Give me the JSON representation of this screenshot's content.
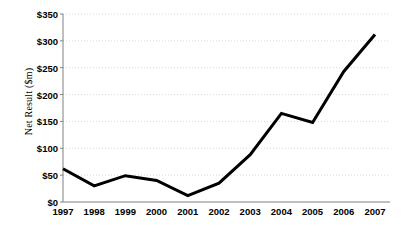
{
  "chart_data": {
    "type": "line",
    "title": "",
    "xlabel": "",
    "ylabel": "Net Result ($m)",
    "categories": [
      "1997",
      "1998",
      "1999",
      "2000",
      "2001",
      "2002",
      "2003",
      "2004",
      "2005",
      "2006",
      "2007"
    ],
    "x": [
      1997,
      1998,
      1999,
      2000,
      2001,
      2002,
      2003,
      2004,
      2005,
      2006,
      2007
    ],
    "values": [
      62,
      30,
      49,
      40,
      12,
      35,
      88,
      165,
      148,
      243,
      312
    ],
    "series": [
      {
        "name": "Net Result",
        "values": [
          62,
          30,
          49,
          40,
          12,
          35,
          88,
          165,
          148,
          243,
          312
        ]
      }
    ],
    "ylim": [
      0,
      350
    ],
    "ytick_values": [
      0,
      50,
      100,
      150,
      200,
      250,
      300,
      350
    ],
    "ytick_labels": [
      "$0",
      "$50",
      "$100",
      "$150",
      "$200",
      "$250",
      "$300",
      "$350"
    ],
    "grid": true,
    "grid_axis": "y",
    "grid_style": "dotted",
    "legend": false,
    "legend_position": "none",
    "line_color": "#000000",
    "line_width": 3,
    "markers": false,
    "grid_color": "#d9d9d9",
    "axis_color": "#808080",
    "background_color": "#ffffff",
    "annotations": []
  }
}
